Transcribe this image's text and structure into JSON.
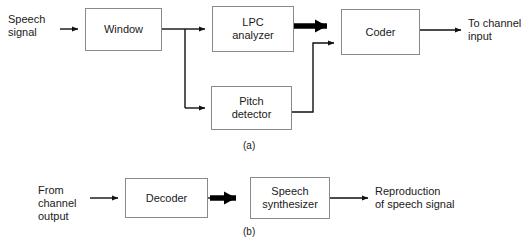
{
  "figure": {
    "background_color": "#ffffff",
    "line_color": "#111111",
    "box_border_color": "#8a8a8a",
    "text_color": "#1a1a1a"
  },
  "diagram_a": {
    "caption": "(a)",
    "input_label": "Speech\nsignal",
    "output_label": "To channel\ninput",
    "blocks": [
      {
        "id": "window",
        "label": "Window"
      },
      {
        "id": "lpc-analyzer",
        "label": "LPC\nanalyzer"
      },
      {
        "id": "pitch-detector",
        "label": "Pitch\ndetector"
      },
      {
        "id": "coder",
        "label": "Coder"
      }
    ]
  },
  "diagram_b": {
    "caption": "(b)",
    "input_label": "From\nchannel\noutput",
    "output_label": "Reproduction\nof speech signal",
    "blocks": [
      {
        "id": "decoder",
        "label": "Decoder"
      },
      {
        "id": "speech-synthesizer",
        "label": "Speech\nsynthesizer"
      }
    ]
  }
}
